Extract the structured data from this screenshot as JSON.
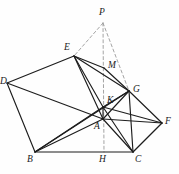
{
  "figure": {
    "background_color": "#fefefe",
    "stroke_color": "#1d1d1d",
    "dash_color": "#9a9a9a",
    "width": 179,
    "height": 174,
    "points": {
      "P": {
        "x": 103,
        "y": 23,
        "label": "P",
        "label_x": 99,
        "label_y": 8
      },
      "E": {
        "x": 74,
        "y": 56,
        "label": "E",
        "label_x": 64,
        "label_y": 43
      },
      "M": {
        "x": 104,
        "y": 68,
        "label": "M",
        "label_x": 108,
        "label_y": 61
      },
      "G": {
        "x": 129,
        "y": 91,
        "label": "G",
        "label_x": 133,
        "label_y": 85
      },
      "D": {
        "x": 7,
        "y": 83,
        "label": "D",
        "label_x": 0,
        "label_y": 77
      },
      "K": {
        "x": 103,
        "y": 107,
        "label": "K",
        "label_x": 107,
        "label_y": 96
      },
      "A": {
        "x": 103,
        "y": 119,
        "label": "A",
        "label_x": 94,
        "label_y": 122
      },
      "F": {
        "x": 162,
        "y": 123,
        "label": "F",
        "label_x": 165,
        "label_y": 117
      },
      "B": {
        "x": 35,
        "y": 152,
        "label": "B",
        "label_x": 27,
        "label_y": 155
      },
      "H": {
        "x": 104,
        "y": 152,
        "label": "H",
        "label_x": 99,
        "label_y": 155
      },
      "C": {
        "x": 133,
        "y": 152,
        "label": "C",
        "label_x": 135,
        "label_y": 155
      }
    },
    "solid_edges": [
      [
        "D",
        "E"
      ],
      [
        "D",
        "B"
      ],
      [
        "D",
        "A"
      ],
      [
        "E",
        "M"
      ],
      [
        "M",
        "G"
      ],
      [
        "E",
        "A"
      ],
      [
        "E",
        "K"
      ],
      [
        "B",
        "C"
      ],
      [
        "B",
        "K"
      ],
      [
        "B",
        "A"
      ],
      [
        "B",
        "G"
      ],
      [
        "C",
        "G"
      ],
      [
        "C",
        "F"
      ],
      [
        "G",
        "F"
      ],
      [
        "G",
        "K"
      ],
      [
        "A",
        "C"
      ],
      [
        "A",
        "F"
      ],
      [
        "A",
        "G"
      ],
      [
        "A",
        "K"
      ],
      [
        "K",
        "C"
      ],
      [
        "K",
        "F"
      ],
      [
        "E",
        "G"
      ]
    ],
    "dashed_edges": [
      [
        "P",
        "E"
      ],
      [
        "P",
        "G"
      ],
      [
        "P",
        "H"
      ]
    ],
    "vertex_labels": [
      "P",
      "E",
      "M",
      "G",
      "D",
      "K",
      "A",
      "F",
      "B",
      "H",
      "C"
    ]
  }
}
